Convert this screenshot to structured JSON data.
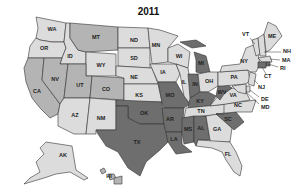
{
  "title": "2011",
  "colors": {
    "light": "#dcdcdc",
    "medium": "#b4b4b4",
    "dark": "#6e6e6e",
    "outline": "#333333",
    "background": "#ffffff"
  },
  "states": {
    "WA": {
      "label": "WA",
      "shade": "light"
    },
    "OR": {
      "label": "OR",
      "shade": "light"
    },
    "CA": {
      "label": "CA",
      "shade": "medium"
    },
    "ID": {
      "label": "ID",
      "shade": "light"
    },
    "NV": {
      "label": "NV",
      "shade": "medium"
    },
    "MT": {
      "label": "MT",
      "shade": "medium"
    },
    "WY": {
      "label": "WY",
      "shade": "light"
    },
    "UT": {
      "label": "UT",
      "shade": "medium"
    },
    "AZ": {
      "label": "AZ",
      "shade": "light"
    },
    "CO": {
      "label": "CO",
      "shade": "medium"
    },
    "NM": {
      "label": "NM",
      "shade": "light"
    },
    "ND": {
      "label": "ND",
      "shade": "light"
    },
    "SD": {
      "label": "SD",
      "shade": "light"
    },
    "NE": {
      "label": "NE",
      "shade": "light"
    },
    "KS": {
      "label": "KS",
      "shade": "light"
    },
    "OK": {
      "label": "OK",
      "shade": "dark"
    },
    "TX": {
      "label": "TX",
      "shade": "dark"
    },
    "MN": {
      "label": "MN",
      "shade": "light"
    },
    "IA": {
      "label": "IA",
      "shade": "light"
    },
    "MO": {
      "label": "MO",
      "shade": "dark"
    },
    "AR": {
      "label": "AR",
      "shade": "dark"
    },
    "LA": {
      "label": "LA",
      "shade": "dark"
    },
    "WI": {
      "label": "WI",
      "shade": "light"
    },
    "IL": {
      "label": "IL",
      "shade": "light"
    },
    "MI": {
      "label": "MI",
      "shade": "dark"
    },
    "IN": {
      "label": "IN",
      "shade": "dark"
    },
    "OH": {
      "label": "OH",
      "shade": "light"
    },
    "KY": {
      "label": "KY",
      "shade": "dark"
    },
    "TN": {
      "label": "TN",
      "shade": "light"
    },
    "MS": {
      "label": "MS",
      "shade": "dark"
    },
    "AL": {
      "label": "AL",
      "shade": "dark"
    },
    "GA": {
      "label": "GA",
      "shade": "light"
    },
    "FL": {
      "label": "FL",
      "shade": "light"
    },
    "SC": {
      "label": "SC",
      "shade": "dark"
    },
    "NC": {
      "label": "NC",
      "shade": "light"
    },
    "VA": {
      "label": "VA",
      "shade": "light"
    },
    "WV": {
      "label": "WV",
      "shade": "dark"
    },
    "PA": {
      "label": "PA",
      "shade": "light"
    },
    "NY": {
      "label": "NY",
      "shade": "light"
    },
    "VT": {
      "label": "VT",
      "shade": "light"
    },
    "NH": {
      "label": "NH",
      "shade": "light"
    },
    "ME": {
      "label": "ME",
      "shade": "light"
    },
    "MA": {
      "label": "MA",
      "shade": "light"
    },
    "RI": {
      "label": "RI",
      "shade": "dark"
    },
    "CT": {
      "label": "CT",
      "shade": "dark"
    },
    "NJ": {
      "label": "NJ",
      "shade": "light"
    },
    "DE": {
      "label": "DE",
      "shade": "light"
    },
    "MD": {
      "label": "MD",
      "shade": "light"
    },
    "AK": {
      "label": "AK",
      "shade": "light"
    },
    "HI": {
      "label": "HI",
      "shade": "medium"
    }
  }
}
